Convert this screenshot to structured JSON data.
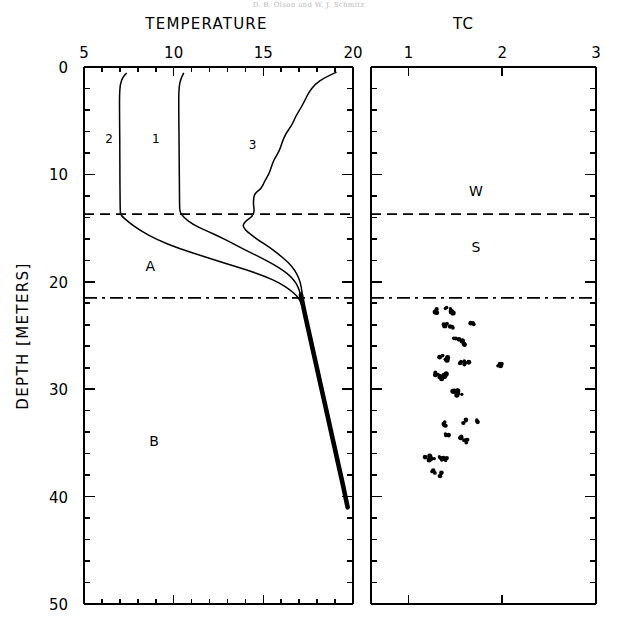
{
  "header": {
    "running_head": "D. B. Olson and W. J. Schmitz"
  },
  "figure": {
    "left_panel": {
      "axis_title": "TEMPERATURE",
      "x_ticks": [
        5,
        10,
        15,
        20
      ],
      "x_tick_labels": [
        "5",
        "10",
        "15",
        "20"
      ],
      "xlim": [
        5,
        20
      ],
      "minor_tick_step": 1,
      "annotations": [
        {
          "name": "layer-a-label",
          "text": "A",
          "x": 8.7,
          "y": 19.0
        },
        {
          "name": "layer-b-label",
          "text": "B",
          "x": 8.9,
          "y": 35.3
        }
      ],
      "curve_labels": [
        {
          "name": "curve-2-label",
          "text": "2",
          "x": 6.4,
          "y": 7.1
        },
        {
          "name": "curve-1-label",
          "text": "1",
          "x": 9.0,
          "y": 7.1
        },
        {
          "name": "curve-3-label",
          "text": "3",
          "x": 14.4,
          "y": 7.6
        }
      ]
    },
    "right_panel": {
      "axis_title": "TC",
      "x_ticks": [
        1,
        2,
        3
      ],
      "x_tick_labels": [
        "1",
        "2",
        "3"
      ],
      "xlim": [
        0.6,
        3.0
      ],
      "annotations": [
        {
          "name": "winter-label",
          "text": "W",
          "x": 1.72,
          "y": 12.0
        },
        {
          "name": "summer-label",
          "text": "S",
          "x": 1.72,
          "y": 17.2
        }
      ]
    },
    "y_axis": {
      "label": "DEPTH  [METERS]",
      "ticks": [
        0,
        10,
        20,
        30,
        40,
        50
      ],
      "tick_labels": [
        "0",
        "10",
        "20",
        "30",
        "40",
        "50"
      ],
      "ylim": [
        0,
        50
      ],
      "minor_tick_step": 2
    },
    "reference_lines": [
      {
        "name": "thermocline-top-line",
        "depth": 13.7,
        "style": "dashed"
      },
      {
        "name": "thermocline-base-line",
        "depth": 21.5,
        "style": "dash-dot"
      }
    ]
  },
  "chart_data": {
    "type": "line",
    "title": "",
    "xlabel": "TEMPERATURE",
    "ylabel": "DEPTH  [METERS]",
    "xlim": [
      5,
      20
    ],
    "ylim": [
      50,
      0
    ],
    "grid": false,
    "legend": "inline-curve-numbers",
    "series": [
      {
        "name": "2",
        "label": "Profile 2",
        "points": [
          [
            7.35,
            0.6
          ],
          [
            7.15,
            1.0
          ],
          [
            7.02,
            1.6
          ],
          [
            6.98,
            2.6
          ],
          [
            6.98,
            4.0
          ],
          [
            6.99,
            6.0
          ],
          [
            7.0,
            8.0
          ],
          [
            7.0,
            10.0
          ],
          [
            7.01,
            12.0
          ],
          [
            7.02,
            13.4
          ],
          [
            7.05,
            13.8
          ],
          [
            7.45,
            14.4
          ],
          [
            8.1,
            15.2
          ],
          [
            9.1,
            16.1
          ],
          [
            10.3,
            16.9
          ],
          [
            11.6,
            17.6
          ],
          [
            12.9,
            18.3
          ],
          [
            14.1,
            18.9
          ],
          [
            15.1,
            19.5
          ],
          [
            15.9,
            20.1
          ],
          [
            16.45,
            20.7
          ],
          [
            16.8,
            21.2
          ],
          [
            17.0,
            21.6
          ],
          [
            17.15,
            22.2
          ]
        ]
      },
      {
        "name": "1",
        "label": "Profile 1",
        "points": [
          [
            10.55,
            0.6
          ],
          [
            10.4,
            1.1
          ],
          [
            10.3,
            1.8
          ],
          [
            10.28,
            3.0
          ],
          [
            10.29,
            5.0
          ],
          [
            10.3,
            7.0
          ],
          [
            10.31,
            9.0
          ],
          [
            10.32,
            11.0
          ],
          [
            10.33,
            13.0
          ],
          [
            10.35,
            13.5
          ],
          [
            10.55,
            14.0
          ],
          [
            11.1,
            14.7
          ],
          [
            11.9,
            15.3
          ],
          [
            12.55,
            15.8
          ],
          [
            13.15,
            16.3
          ],
          [
            13.95,
            17.0
          ],
          [
            14.8,
            17.7
          ],
          [
            15.6,
            18.4
          ],
          [
            16.25,
            19.1
          ],
          [
            16.7,
            19.8
          ],
          [
            16.95,
            20.5
          ],
          [
            17.08,
            21.2
          ],
          [
            17.15,
            22.0
          ]
        ]
      },
      {
        "name": "3",
        "label": "Profile 3",
        "points": [
          [
            19.05,
            0.5
          ],
          [
            18.4,
            1.0
          ],
          [
            17.9,
            1.6
          ],
          [
            17.55,
            2.3
          ],
          [
            17.35,
            3.0
          ],
          [
            17.1,
            3.8
          ],
          [
            16.8,
            4.6
          ],
          [
            16.6,
            5.4
          ],
          [
            16.25,
            6.2
          ],
          [
            16.05,
            7.0
          ],
          [
            15.9,
            7.8
          ],
          [
            15.6,
            8.6
          ],
          [
            15.45,
            9.3
          ],
          [
            15.3,
            10.0
          ],
          [
            15.05,
            10.7
          ],
          [
            14.9,
            11.3
          ],
          [
            14.55,
            11.7
          ],
          [
            14.45,
            12.2
          ],
          [
            14.45,
            12.9
          ],
          [
            14.5,
            13.4
          ],
          [
            14.4,
            13.9
          ],
          [
            14.05,
            14.3
          ],
          [
            13.85,
            14.7
          ],
          [
            13.95,
            15.1
          ],
          [
            14.3,
            15.6
          ],
          [
            14.8,
            16.2
          ],
          [
            15.35,
            16.8
          ],
          [
            15.9,
            17.5
          ],
          [
            16.4,
            18.2
          ],
          [
            16.75,
            18.9
          ],
          [
            17.0,
            19.7
          ],
          [
            17.12,
            20.5
          ],
          [
            17.18,
            21.3
          ],
          [
            17.2,
            22.0
          ]
        ]
      },
      {
        "name": "merged",
        "label": "Merged deep profile",
        "thick": true,
        "points": [
          [
            17.1,
            21.2
          ],
          [
            17.25,
            22.5
          ],
          [
            17.45,
            24.0
          ],
          [
            17.65,
            25.5
          ],
          [
            17.85,
            27.0
          ],
          [
            18.05,
            28.5
          ],
          [
            18.25,
            30.0
          ],
          [
            18.45,
            31.5
          ],
          [
            18.65,
            33.0
          ],
          [
            18.85,
            34.5
          ],
          [
            19.05,
            36.0
          ],
          [
            19.25,
            37.5
          ],
          [
            19.45,
            39.0
          ],
          [
            19.7,
            41.0
          ]
        ]
      }
    ],
    "scatter": {
      "name": "TC",
      "xlabel": "TC",
      "xlim": [
        0.6,
        3.0
      ],
      "points": [
        [
          1.29,
          22.7
        ],
        [
          1.42,
          22.5
        ],
        [
          1.46,
          22.8
        ],
        [
          1.4,
          24.0
        ],
        [
          1.46,
          24.2
        ],
        [
          1.67,
          24.0
        ],
        [
          1.51,
          25.4
        ],
        [
          1.57,
          25.7
        ],
        [
          1.35,
          27.0
        ],
        [
          1.4,
          27.2
        ],
        [
          1.57,
          27.4
        ],
        [
          1.62,
          27.6
        ],
        [
          1.97,
          27.8
        ],
        [
          1.31,
          28.6
        ],
        [
          1.35,
          28.9
        ],
        [
          1.38,
          28.7
        ],
        [
          1.5,
          30.2
        ],
        [
          1.54,
          30.4
        ],
        [
          1.4,
          33.2
        ],
        [
          1.59,
          33.0
        ],
        [
          1.71,
          33.0
        ],
        [
          1.4,
          34.2
        ],
        [
          1.57,
          34.6
        ],
        [
          1.63,
          34.8
        ],
        [
          1.2,
          36.4
        ],
        [
          1.26,
          36.6
        ],
        [
          1.33,
          36.4
        ],
        [
          1.38,
          36.5
        ],
        [
          1.27,
          37.6
        ],
        [
          1.34,
          37.9
        ]
      ]
    }
  }
}
